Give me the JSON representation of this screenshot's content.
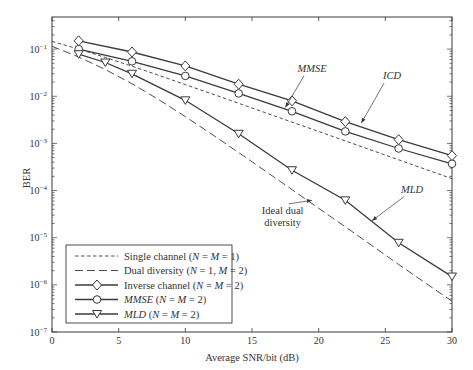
{
  "chart_data": {
    "type": "line",
    "title": "",
    "xlabel": "Average SNR/bit (dB)",
    "ylabel": "BER",
    "xlim": [
      0,
      30
    ],
    "ylim": [
      1e-07,
      0.48
    ],
    "yscale": "log",
    "grid": false,
    "x_ticks": [
      0,
      5,
      10,
      15,
      20,
      25,
      30
    ],
    "x_tick_labels": [
      "0",
      "5",
      "10",
      "15",
      "20",
      "25",
      "30"
    ],
    "y_ticks": [
      0.1,
      0.01,
      0.001,
      0.0001,
      1e-05,
      1e-06,
      1e-07
    ],
    "y_tick_labels": [
      {
        "base": "10",
        "exp": "−1"
      },
      {
        "base": "10",
        "exp": "−2"
      },
      {
        "base": "10",
        "exp": "−3"
      },
      {
        "base": "10",
        "exp": "−4"
      },
      {
        "base": "10",
        "exp": "−5"
      },
      {
        "base": "10",
        "exp": "−6"
      },
      {
        "base": "10",
        "exp": "−7"
      }
    ],
    "legend_position": "bottom-left",
    "series": [
      {
        "name": "Single channel (N = M = 1)",
        "legend_parts": [
          [
            "Single channel (",
            false
          ],
          [
            "N",
            true
          ],
          [
            " = ",
            false
          ],
          [
            "M",
            true
          ],
          [
            " = 1)",
            false
          ]
        ],
        "style": "short-dash",
        "marker": "none",
        "x": [
          0,
          2,
          4,
          6,
          8,
          10,
          12,
          14,
          16,
          18,
          20,
          22,
          24,
          26,
          28,
          30
        ],
        "y": [
          0.146,
          0.1,
          0.0667,
          0.0434,
          0.0278,
          0.0177,
          0.0112,
          0.00709,
          0.00448,
          0.00283,
          0.00179,
          0.00113,
          0.000711,
          0.000449,
          0.000283,
          0.000179
        ]
      },
      {
        "name": "Dual diversity (N = 1, M = 2)",
        "legend_parts": [
          [
            "Dual diversity (",
            false
          ],
          [
            "N",
            true
          ],
          [
            " = 1, ",
            false
          ],
          [
            "M",
            true
          ],
          [
            " = 2)",
            false
          ]
        ],
        "style": "long-dash",
        "marker": "none",
        "x": [
          0,
          2,
          4,
          6,
          8,
          10,
          12,
          14,
          16,
          18,
          20,
          22,
          24,
          26,
          28,
          30
        ],
        "y": [
          0.115,
          0.068,
          0.037,
          0.0185,
          0.0085,
          0.0037,
          0.00155,
          0.00064,
          0.00026,
          0.000105,
          4.2e-05,
          1.7e-05,
          6.8e-06,
          2.7e-06,
          1.1e-06,
          4.5e-07
        ]
      },
      {
        "name": "Inverse channel (N = M = 2)",
        "legend_parts": [
          [
            "Inverse channel (",
            false
          ],
          [
            "N",
            true
          ],
          [
            " = ",
            false
          ],
          [
            "M",
            true
          ],
          [
            " = 2)",
            false
          ]
        ],
        "style": "solid",
        "marker": "diamond",
        "x": [
          2,
          6,
          10,
          14,
          18,
          22,
          26,
          30
        ],
        "y": [
          0.15,
          0.087,
          0.044,
          0.018,
          0.008,
          0.0029,
          0.0012,
          0.00055
        ]
      },
      {
        "name": "MMSE (N = M = 2)",
        "legend_parts": [
          [
            "MMSE",
            true
          ],
          [
            " (",
            false
          ],
          [
            "N",
            true
          ],
          [
            " = ",
            false
          ],
          [
            "M",
            true
          ],
          [
            " = 2)",
            false
          ]
        ],
        "style": "solid",
        "marker": "circle",
        "x": [
          2,
          6,
          10,
          14,
          18,
          22,
          26,
          30
        ],
        "y": [
          0.1,
          0.055,
          0.027,
          0.0115,
          0.0048,
          0.0018,
          0.00078,
          0.00037
        ]
      },
      {
        "name": "MLD (N = M = 2)",
        "legend_parts": [
          [
            "MLD",
            true
          ],
          [
            " (",
            false
          ],
          [
            "N",
            true
          ],
          [
            " = ",
            false
          ],
          [
            "M",
            true
          ],
          [
            " = 2)",
            false
          ]
        ],
        "style": "solid",
        "marker": "triangle-down",
        "x": [
          2,
          4,
          6,
          10,
          14,
          18,
          22,
          26,
          30
        ],
        "y": [
          0.078,
          0.052,
          0.03,
          0.0082,
          0.0016,
          0.00027,
          6.2e-05,
          7.8e-06,
          1.5e-06
        ]
      }
    ],
    "annotations": [
      {
        "text": "MMSE",
        "italic": true,
        "text_at": [
          19.5,
          0.033
        ],
        "arrow_to": [
          17.5,
          0.0058
        ]
      },
      {
        "text": "ICD",
        "italic": true,
        "text_at": [
          25.5,
          0.023
        ],
        "arrow_to": [
          23.2,
          0.0027
        ]
      },
      {
        "text": "MLD",
        "italic": true,
        "text_at": [
          27.0,
          9e-05
        ],
        "arrow_to": [
          24.0,
          2.3e-05
        ]
      },
      {
        "text": "Ideal dual",
        "italic": false,
        "text_at": [
          17.3,
          3.2e-05
        ],
        "arrow_to": [
          19.5,
          6.2e-05
        ],
        "line2": "diversity"
      }
    ]
  }
}
